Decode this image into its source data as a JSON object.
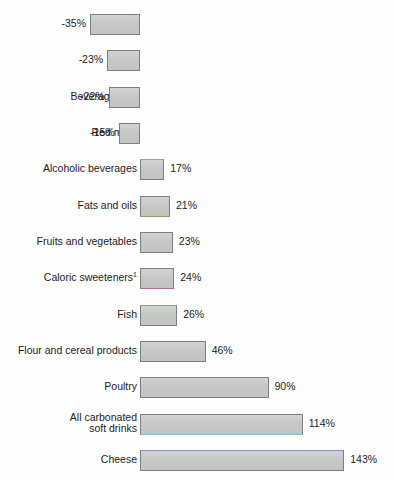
{
  "chart_data": {
    "type": "bar",
    "orientation": "horizontal",
    "title": "",
    "subtitle": "",
    "xlabel": "",
    "ylabel": "",
    "grid": false,
    "legend": null,
    "axis_zero_at_px": 140,
    "px_per_percent": 1.428,
    "xlim": [
      -35,
      143
    ],
    "categories": [
      "Coffee",
      "Eggs",
      "Beverage milk",
      "Red meat",
      "Alcoholic beverages",
      "Fats and oils",
      "Fruits and vegetables",
      "Caloric sweeteners",
      "Fish",
      "Flour and cereal products",
      "Poultry",
      "All carbonated soft drinks",
      "Cheese"
    ],
    "values": [
      -35,
      -23,
      -22,
      -15,
      17,
      21,
      23,
      24,
      26,
      46,
      90,
      114,
      143
    ],
    "value_labels": [
      "-35%",
      "-23%",
      "-22%",
      "-15%",
      "17%",
      "21%",
      "23%",
      "24%",
      "26%",
      "46%",
      "90%",
      "114%",
      "143%"
    ],
    "footnote_markers": {
      "Caloric sweeteners": "1"
    }
  },
  "rows": [
    {
      "label": "Coffee",
      "label_sup": "",
      "value": -35,
      "value_label": "-35%",
      "two_line": false,
      "label_line1": "Coffee",
      "label_line2": "",
      "tint": ""
    },
    {
      "label": "Eggs",
      "label_sup": "",
      "value": -23,
      "value_label": "-23%",
      "two_line": false,
      "label_line1": "Eggs",
      "label_line2": "",
      "tint": ""
    },
    {
      "label": "Beverage milk",
      "label_sup": "",
      "value": -22,
      "value_label": "-22%",
      "two_line": false,
      "label_line1": "Beverage milk",
      "label_line2": "",
      "tint": ""
    },
    {
      "label": "Red meat",
      "label_sup": "",
      "value": -15,
      "value_label": "-15%",
      "two_line": false,
      "label_line1": "Red meat",
      "label_line2": "",
      "tint": ""
    },
    {
      "label": "Alcoholic beverages",
      "label_sup": "",
      "value": 17,
      "value_label": "17%",
      "two_line": false,
      "label_line1": "Alcoholic beverages",
      "label_line2": "",
      "tint": "tint-red"
    },
    {
      "label": "Fats and oils",
      "label_sup": "",
      "value": 21,
      "value_label": "21%",
      "two_line": false,
      "label_line1": "Fats and oils",
      "label_line2": "",
      "tint": "tint-olive"
    },
    {
      "label": "Fruits and vegetables",
      "label_sup": "",
      "value": 23,
      "value_label": "23%",
      "two_line": false,
      "label_line1": "Fruits and vegetables",
      "label_line2": "",
      "tint": ""
    },
    {
      "label": "Caloric sweeteners",
      "label_sup": "1",
      "value": 24,
      "value_label": "24%",
      "two_line": false,
      "label_line1": "Caloric sweeteners",
      "label_line2": "",
      "tint": "tint-magenta"
    },
    {
      "label": "Fish",
      "label_sup": "",
      "value": 26,
      "value_label": "26%",
      "two_line": false,
      "label_line1": "Fish",
      "label_line2": "",
      "tint": "tint-green"
    },
    {
      "label": "Flour and cereal products",
      "label_sup": "",
      "value": 46,
      "value_label": "46%",
      "two_line": false,
      "label_line1": "Flour and cereal products",
      "label_line2": "",
      "tint": ""
    },
    {
      "label": "Poultry",
      "label_sup": "",
      "value": 90,
      "value_label": "90%",
      "two_line": false,
      "label_line1": "Poultry",
      "label_line2": "",
      "tint": ""
    },
    {
      "label": "All carbonated soft drinks",
      "label_sup": "",
      "value": 114,
      "value_label": "114%",
      "two_line": true,
      "label_line1": "All carbonated",
      "label_line2": "soft drinks",
      "tint": "tint-cyan"
    },
    {
      "label": "Cheese",
      "label_sup": "",
      "value": 143,
      "value_label": "143%",
      "two_line": false,
      "label_line1": "Cheese",
      "label_line2": "",
      "tint": "tint-blue"
    }
  ],
  "colors": {
    "bar_fill": "#c9cbc9",
    "bar_stroke": "#7c7f7c",
    "text": "#1b1b1b",
    "background": "#fefefe"
  }
}
